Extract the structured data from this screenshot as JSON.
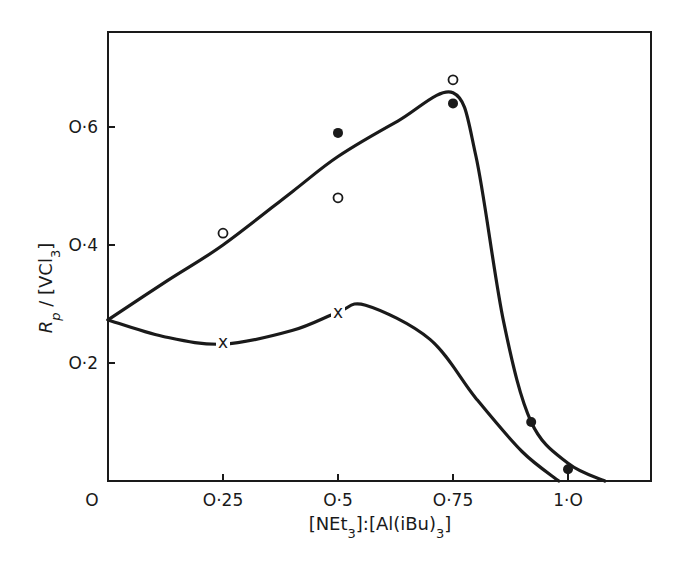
{
  "chart_data": {
    "type": "line",
    "title": "",
    "xlabel": "[NEt3]:[Al(iBu)3]",
    "ylabel": "Rp / [VCl3]",
    "xlim": [
      0,
      1.2
    ],
    "ylim": [
      0,
      0.76
    ],
    "grid": false,
    "legend": null,
    "x_ticks": [
      {
        "value": 0,
        "label": "O"
      },
      {
        "value": 0.25,
        "label": "O·25"
      },
      {
        "value": 0.5,
        "label": "O·5"
      },
      {
        "value": 0.75,
        "label": "O·75"
      },
      {
        "value": 1.0,
        "label": "1·O"
      }
    ],
    "y_ticks": [
      {
        "value": 0.2,
        "label": "O·2"
      },
      {
        "value": 0.4,
        "label": "O·4"
      },
      {
        "value": 0.6,
        "label": "O·6"
      }
    ],
    "series": [
      {
        "name": "open circles",
        "marker": "open-circle",
        "x": [
          0.25,
          0.5,
          0.75
        ],
        "y": [
          0.42,
          0.48,
          0.68
        ]
      },
      {
        "name": "filled circles",
        "marker": "filled-circle",
        "x": [
          0.5,
          0.75,
          0.92,
          1.0
        ],
        "y": [
          0.59,
          0.64,
          0.1,
          0.02
        ]
      },
      {
        "name": "crosses",
        "marker": "cross",
        "x": [
          0.25,
          0.5
        ],
        "y": [
          0.236,
          0.286
        ]
      }
    ],
    "curves": [
      {
        "name": "upper fitted curve",
        "x": [
          0,
          0.13,
          0.25,
          0.4,
          0.5,
          0.63,
          0.75,
          0.8,
          0.86,
          0.92,
          1.0,
          1.08
        ],
        "y": [
          0.273,
          0.34,
          0.4,
          0.49,
          0.55,
          0.61,
          0.658,
          0.55,
          0.27,
          0.1,
          0.03,
          0.0
        ]
      },
      {
        "name": "lower fitted curve",
        "x": [
          0,
          0.12,
          0.25,
          0.4,
          0.5,
          0.56,
          0.7,
          0.8,
          0.9,
          0.98
        ],
        "y": [
          0.273,
          0.245,
          0.232,
          0.255,
          0.286,
          0.298,
          0.24,
          0.14,
          0.05,
          0.0
        ]
      }
    ]
  }
}
